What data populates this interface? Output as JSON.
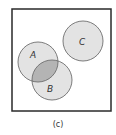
{
  "diagram": {
    "type": "venn",
    "caption": "(c)",
    "universe": {
      "x": 12,
      "y": 9,
      "width": 99,
      "height": 102,
      "stroke": "#2a2a2a"
    },
    "sets": [
      {
        "label": "A",
        "cx": 38,
        "cy": 62,
        "r": 20,
        "fill": "#e3e3e3",
        "stroke": "#6e6e6e"
      },
      {
        "label": "B",
        "cx": 52,
        "cy": 80,
        "r": 20,
        "fill": "#e3e3e3",
        "stroke": "#6e6e6e"
      },
      {
        "label": "C",
        "cx": 83,
        "cy": 41,
        "r": 20,
        "fill": "#e3e3e3",
        "stroke": "#6e6e6e"
      }
    ],
    "labels": {
      "A": "A",
      "B": "B",
      "C": "C"
    },
    "intersection": {
      "sets": [
        "A",
        "B"
      ],
      "fill": "#b4b4b4"
    },
    "relationships": {
      "A_B": "overlapping",
      "A_C": "disjoint",
      "B_C": "disjoint"
    }
  }
}
